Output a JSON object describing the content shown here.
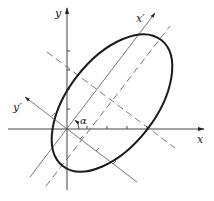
{
  "figure": {
    "labels": {
      "x_axis": "x",
      "y_axis": "y",
      "x_prime_axis": "x′",
      "y_prime_axis": "y′",
      "angle": "α"
    },
    "colors": {
      "ink": "#222222",
      "axis": "#444444",
      "ellipse": "#1a1a1a",
      "background": "#ffffff"
    }
  }
}
